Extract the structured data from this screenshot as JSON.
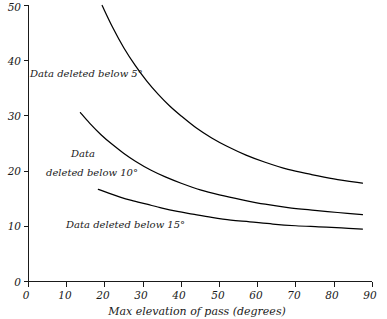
{
  "chart_data": {
    "type": "line",
    "title": "",
    "xlabel": "Max elevation of pass (degrees)",
    "ylabel": "",
    "xlim": [
      0,
      90
    ],
    "ylim": [
      0,
      50
    ],
    "xticks": [
      0,
      10,
      20,
      30,
      40,
      50,
      60,
      70,
      80,
      90
    ],
    "xtick_labels": [
      "0",
      "10",
      "20",
      "30",
      "40",
      "50",
      "60",
      "70",
      "80",
      "90"
    ],
    "yticks": [
      0,
      10,
      20,
      30,
      40,
      50
    ],
    "ytick_labels": [
      "0",
      "10",
      "20",
      "30",
      "40",
      "50"
    ],
    "grid": false,
    "legend_position": "inline-annotations",
    "line_color": "#000000",
    "background_color": "#ffffff",
    "series": [
      {
        "name": "Data deleted below 5°",
        "x": [
          19.3,
          22,
          25,
          28,
          31,
          34,
          37,
          40,
          44,
          48,
          52,
          57,
          62,
          68,
          74,
          80,
          87.5
        ],
        "values": [
          50.0,
          46.1,
          42.3,
          39.1,
          36.3,
          33.9,
          31.8,
          30.0,
          27.8,
          26.0,
          24.5,
          22.9,
          21.6,
          20.3,
          19.4,
          18.6,
          17.8
        ]
      },
      {
        "name": "Data deleted below 10°",
        "x": [
          13.6,
          16,
          19,
          22,
          25,
          28,
          32,
          36,
          40,
          45,
          50,
          56,
          62,
          68,
          75,
          81,
          87.5
        ],
        "values": [
          30.6,
          28.7,
          26.6,
          24.8,
          23.2,
          21.8,
          20.2,
          18.9,
          17.8,
          16.6,
          15.7,
          14.8,
          14.0,
          13.4,
          12.9,
          12.5,
          12.1
        ]
      },
      {
        "name": "Data deleted below 15°",
        "x": [
          18.3,
          21,
          24,
          27,
          31,
          35,
          39,
          43,
          48,
          53,
          58,
          64,
          70,
          76,
          82,
          87.5
        ],
        "values": [
          16.7,
          16.0,
          15.3,
          14.7,
          14.0,
          13.3,
          12.7,
          12.2,
          11.6,
          11.1,
          10.8,
          10.4,
          10.1,
          9.9,
          9.7,
          9.5
        ]
      }
    ],
    "annotations": [
      {
        "text": "Data deleted below 5°",
        "x_px": 30,
        "y_px": 77
      },
      {
        "text": "Data",
        "x_px": 71,
        "y_px": 157
      },
      {
        "text": "deleted below 10°",
        "x_px": 46,
        "y_px": 176
      },
      {
        "text": "Data deleted  below  15°",
        "x_px": 66,
        "y_px": 228
      }
    ]
  },
  "axis": {
    "x_title": "Max elevation of pass (degrees)"
  }
}
